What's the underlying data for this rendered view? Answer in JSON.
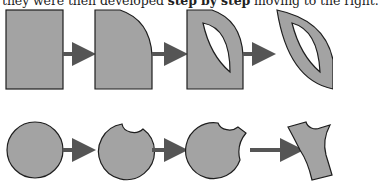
{
  "caption": {
    "before": "they were then developed ",
    "bold": "step by step",
    "after": " moving to the right."
  },
  "colors": {
    "shape_fill": "#a3a3a3",
    "outline": "#1e1e1e",
    "arrow": "#555555",
    "hole": "#ffffff"
  },
  "rows": [
    {
      "name": "square-sequence",
      "steps": [
        "rectangle",
        "rounded-corner rectangle",
        "rounded rectangle with leaf-shaped hole",
        "leaf shape with leaf-shaped hole"
      ]
    },
    {
      "name": "circle-sequence",
      "steps": [
        "circle",
        "circle with top notch",
        "circle with notch and cut",
        "carved fragment"
      ]
    }
  ]
}
